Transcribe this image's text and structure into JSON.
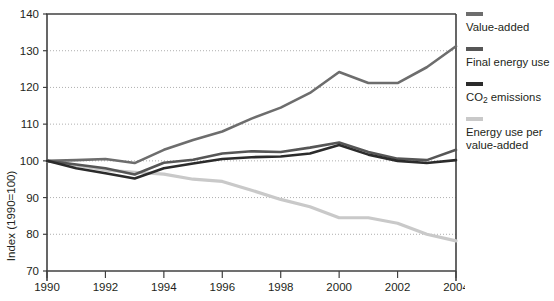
{
  "chart_data": {
    "type": "line",
    "title": "",
    "xlabel": "",
    "ylabel": "Index (1990=100)",
    "xlim": [
      1990,
      2004
    ],
    "ylim": [
      70,
      140
    ],
    "grid": true,
    "legend_position": "right",
    "x": [
      1990,
      1991,
      1992,
      1993,
      1994,
      1995,
      1996,
      1997,
      1998,
      1999,
      2000,
      2001,
      2002,
      2003,
      2004
    ],
    "xticks": [
      "1990",
      "1992",
      "1994",
      "1996",
      "1998",
      "2000",
      "2002",
      "2004"
    ],
    "yticks": [
      "70",
      "80",
      "90",
      "100",
      "110",
      "120",
      "130",
      "140"
    ],
    "series": [
      {
        "name": "Value-added",
        "color": "#6d6d6d",
        "values": [
          100.0,
          100.2,
          100.5,
          99.4,
          103.0,
          105.7,
          108.0,
          111.5,
          114.5,
          118.5,
          124.2,
          121.2,
          121.2,
          125.5,
          131.2
        ]
      },
      {
        "name": "Final energy use",
        "color": "#565656",
        "values": [
          100.0,
          99.0,
          98.0,
          96.3,
          99.5,
          100.3,
          102.0,
          102.6,
          102.4,
          103.6,
          105.0,
          102.4,
          100.6,
          100.2,
          103.0
        ]
      },
      {
        "name": "CO2 emissions",
        "color": "#2b2b2b",
        "values": [
          100.0,
          98.0,
          96.6,
          95.2,
          98.0,
          99.3,
          100.5,
          101.0,
          101.2,
          102.0,
          104.3,
          101.7,
          100.0,
          99.4,
          100.2
        ]
      },
      {
        "name": "Energy use per value-added",
        "color": "#c9c9c9",
        "values": [
          100.0,
          98.8,
          97.5,
          96.9,
          96.4,
          95.0,
          94.4,
          92.0,
          89.5,
          87.5,
          84.5,
          84.5,
          83.0,
          80.0,
          78.2
        ]
      }
    ]
  },
  "axes": {
    "y_axis_title": "Index (1990=100)",
    "y_ticks": [
      "140",
      "130",
      "120",
      "110",
      "100",
      "90",
      "80",
      "70"
    ],
    "x_ticks": [
      "1990",
      "1992",
      "1994",
      "1996",
      "1998",
      "2000",
      "2002",
      "2004"
    ]
  },
  "legend": {
    "items": [
      {
        "label": "Value-added",
        "color": "#6d6d6d"
      },
      {
        "label": "Final energy use",
        "color": "#565656"
      },
      {
        "label": "CO2 emissions",
        "color": "#2b2b2b",
        "has_subscript": true,
        "prefix": "CO",
        "sub": "2",
        "suffix": " emissions"
      },
      {
        "label": "Energy use per\nvalue-added",
        "color": "#c9c9c9"
      }
    ]
  },
  "colors": {
    "axis": "#404040",
    "gridline": "#9a9a9a",
    "text": "#231f20",
    "background": "#ffffff"
  }
}
